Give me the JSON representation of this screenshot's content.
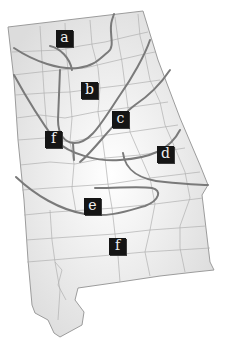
{
  "map": {
    "title": "Alabama region map",
    "fill_color": "#e8e8e8",
    "county_line_color": "#a8a8a8",
    "region_line_color": "#7a7a7a",
    "label_bg": "#151515",
    "label_fg": "#f2f2f2"
  },
  "labels": [
    {
      "id": "a",
      "text": "a",
      "x": 56,
      "y": 30
    },
    {
      "id": "b",
      "text": "b",
      "x": 81,
      "y": 82
    },
    {
      "id": "c",
      "text": "c",
      "x": 112,
      "y": 111
    },
    {
      "id": "f-north",
      "text": "f",
      "x": 45,
      "y": 131
    },
    {
      "id": "d",
      "text": "d",
      "x": 157,
      "y": 146
    },
    {
      "id": "e",
      "text": "e",
      "x": 84,
      "y": 198
    },
    {
      "id": "f-south",
      "text": "f",
      "x": 109,
      "y": 238
    }
  ]
}
